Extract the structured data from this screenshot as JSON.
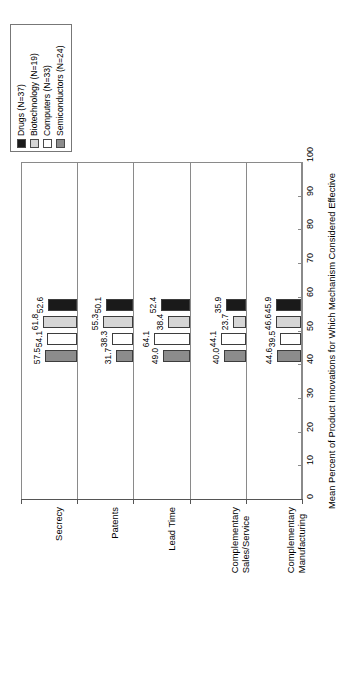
{
  "chart_data": {
    "type": "bar",
    "title": "",
    "subtitle": "",
    "orientation": "rotated-90",
    "categories": [
      "Secrecy",
      "Patents",
      "Lead Time",
      "Complementary Sales/Service",
      "Complementary Manufacturing"
    ],
    "category_lines": [
      [
        "Secrecy"
      ],
      [
        "Patents"
      ],
      [
        "Lead Time"
      ],
      [
        "Complementary",
        "Sales/Service"
      ],
      [
        "Complementary",
        "Manufacturing"
      ]
    ],
    "series": [
      {
        "name": "Drugs (N=37)",
        "color": "#1a1a1a",
        "values": [
          52.6,
          50.1,
          52.4,
          35.9,
          45.9
        ]
      },
      {
        "name": "Biotechnology (N=19)",
        "color": "#d6d6d6",
        "values": [
          61.8,
          55.3,
          38.4,
          23.7,
          46.6
        ]
      },
      {
        "name": "Computers (N=33)",
        "color": "#ffffff",
        "values": [
          54.1,
          38.3,
          64.1,
          44.1,
          39.5
        ]
      },
      {
        "name": "Semiconductors (N=24)",
        "color": "#8c8c8c",
        "values": [
          57.5,
          31.7,
          49.0,
          40.0,
          44.6
        ]
      }
    ],
    "value_labels": [
      [
        "52.6",
        "61.8",
        "54.1",
        "57.5"
      ],
      [
        "50.1",
        "55.3",
        "38.3",
        "31.7"
      ],
      [
        "52.4",
        "38.4",
        "64.1",
        "49.0"
      ],
      [
        "35.9",
        "23.7",
        "44.1",
        "40.0"
      ],
      [
        "45.9",
        "46.6",
        "39.5",
        "44.6"
      ]
    ],
    "xlabel": "",
    "ylabel": "Mean Percent of Product Innovations for Which Mechanism Considered Effective",
    "ylim": [
      0,
      100
    ],
    "yticks": [
      0,
      10,
      20,
      30,
      40,
      50,
      60,
      70,
      80,
      90,
      100
    ],
    "ytick_labels": [
      "0",
      "10",
      "20",
      "30",
      "40",
      "50",
      "60",
      "70",
      "80",
      "90",
      "100"
    ],
    "grid": false,
    "legend_position": "top-left"
  },
  "legend": {
    "items": [
      {
        "label": "Drugs (N=37)",
        "swatch": "#1a1a1a"
      },
      {
        "label": "Biotechnology (N=19)",
        "swatch": "#d6d6d6"
      },
      {
        "label": "Computers (N=33)",
        "swatch": "#ffffff"
      },
      {
        "label": "Semiconductors (N=24)",
        "swatch": "#8c8c8c"
      }
    ]
  }
}
